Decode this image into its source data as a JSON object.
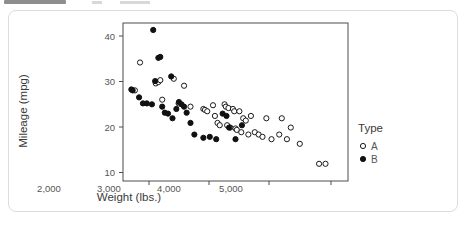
{
  "toolbar": {
    "chip_label": "",
    "present": true
  },
  "card": {
    "name": "figure-card"
  },
  "chart_data": {
    "type": "scatter",
    "title": "",
    "xlabel": "Weight (lbs.)",
    "ylabel": "Mileage (mpg)",
    "xlim": [
      1650,
      5150
    ],
    "ylim": [
      8.5,
      42.5
    ],
    "xticks": [
      2000,
      3000,
      4000,
      5000
    ],
    "xticklabels": [
      "2,000",
      "3,000",
      "4,000",
      "5,000"
    ],
    "yticks": [
      10,
      20,
      30,
      40
    ],
    "yticklabels": [
      "10",
      "20",
      "30",
      "40"
    ],
    "grid": false,
    "legend": {
      "title": "Type",
      "position": "right",
      "entries": [
        {
          "label": "A",
          "marker": "open-circle",
          "color": "#1a1a1a"
        },
        {
          "label": "B",
          "marker": "filled-circle",
          "color": "#111111"
        }
      ]
    },
    "series": [
      {
        "name": "A",
        "marker": "open-circle",
        "points": [
          [
            1835,
            28.0
          ],
          [
            1915,
            34.0
          ],
          [
            2160,
            29.5
          ],
          [
            2200,
            29.8
          ],
          [
            2230,
            30.2
          ],
          [
            2260,
            26.0
          ],
          [
            2440,
            30.5
          ],
          [
            2515,
            25.2
          ],
          [
            2600,
            29.0
          ],
          [
            2700,
            24.5
          ],
          [
            2900,
            24.0
          ],
          [
            2925,
            23.8
          ],
          [
            2960,
            23.5
          ],
          [
            3050,
            24.8
          ],
          [
            3080,
            22.5
          ],
          [
            3120,
            21.0
          ],
          [
            3155,
            20.5
          ],
          [
            3230,
            25.0
          ],
          [
            3250,
            24.5
          ],
          [
            3270,
            20.5
          ],
          [
            3290,
            24.2
          ],
          [
            3320,
            20.0
          ],
          [
            3360,
            24.0
          ],
          [
            3380,
            23.5
          ],
          [
            3400,
            19.8
          ],
          [
            3420,
            19.5
          ],
          [
            3460,
            23.5
          ],
          [
            3490,
            19.0
          ],
          [
            3520,
            22.0
          ],
          [
            3560,
            21.5
          ],
          [
            3600,
            18.5
          ],
          [
            3640,
            22.5
          ],
          [
            3700,
            19.0
          ],
          [
            3760,
            18.5
          ],
          [
            3820,
            18.0
          ],
          [
            3880,
            22.0
          ],
          [
            3960,
            17.5
          ],
          [
            4080,
            18.5
          ],
          [
            4120,
            22.0
          ],
          [
            4200,
            17.5
          ],
          [
            4260,
            20.0
          ],
          [
            4400,
            16.5
          ],
          [
            4700,
            12.2
          ],
          [
            4800,
            12.2
          ]
        ]
      },
      {
        "name": "B",
        "marker": "filled-circle",
        "points": [
          [
            1780,
            28.2
          ],
          [
            1800,
            28.0
          ],
          [
            1900,
            26.5
          ],
          [
            1960,
            25.2
          ],
          [
            2020,
            25.2
          ],
          [
            2100,
            25.0
          ],
          [
            2120,
            41.0
          ],
          [
            2150,
            30.0
          ],
          [
            2200,
            35.0
          ],
          [
            2230,
            35.2
          ],
          [
            2260,
            24.5
          ],
          [
            2300,
            23.2
          ],
          [
            2350,
            23.0
          ],
          [
            2400,
            31.0
          ],
          [
            2420,
            22.0
          ],
          [
            2480,
            24.0
          ],
          [
            2520,
            25.5
          ],
          [
            2560,
            25.0
          ],
          [
            2600,
            24.5
          ],
          [
            2640,
            23.2
          ],
          [
            2700,
            21.0
          ],
          [
            2760,
            18.5
          ],
          [
            2900,
            17.8
          ],
          [
            3000,
            18.0
          ],
          [
            3100,
            17.5
          ],
          [
            3200,
            23.0
          ],
          [
            3260,
            22.5
          ],
          [
            3300,
            20.0
          ],
          [
            3400,
            17.5
          ],
          [
            3500,
            20.5
          ]
        ]
      }
    ]
  }
}
